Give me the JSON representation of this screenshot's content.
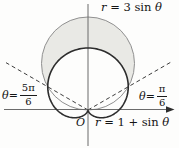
{
  "figure": {
    "labels": {
      "circle": {
        "var1": "r",
        "mid": " = 3 sin ",
        "var2": "θ"
      },
      "cardioid": {
        "var1": "r",
        "mid": " = 1 + sin ",
        "var2": "θ"
      },
      "angle_left": {
        "var": "θ",
        "eq": " = ",
        "num": "5π",
        "den": "6"
      },
      "angle_right": {
        "var": "θ",
        "eq": " = ",
        "num": "π",
        "den": "6"
      },
      "origin": "O"
    },
    "colors": {
      "shade": "#e9e9e5",
      "circle_stroke": "#909090",
      "cardioid_stroke": "#2d2d2d",
      "dashed_stroke": "#3d3d3d",
      "axis_stroke": "#6b6b6b",
      "text": "#141414"
    },
    "geometry": {
      "origin_x": 88,
      "origin_y": 110,
      "scale": 31,
      "circle_coeff": 3,
      "cardioid_const": 1,
      "theta_right_deg": 30,
      "theta_left_deg": 150
    }
  }
}
